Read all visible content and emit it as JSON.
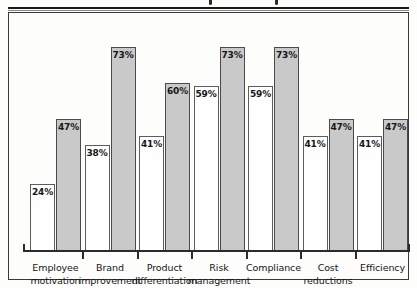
{
  "chart_data": {
    "type": "bar",
    "title": "",
    "xlabel": "",
    "ylabel": "",
    "ylim": [
      0,
      80
    ],
    "grid": false,
    "legend_position": "none",
    "categories": [
      "Employee motivation",
      "Brand improvement",
      "Product differentiation",
      "Risk management",
      "Compliance",
      "Cost reductions",
      "Efficiency"
    ],
    "series": [
      {
        "name": "series-1",
        "color": "#fefefe",
        "values": [
          24,
          38,
          41,
          59,
          59,
          41,
          41
        ]
      },
      {
        "name": "series-2",
        "color": "#c9c9c9",
        "values": [
          47,
          73,
          60,
          73,
          73,
          47,
          47
        ]
      }
    ],
    "value_labels": [
      [
        "24%",
        "47%"
      ],
      [
        "38%",
        "73%"
      ],
      [
        "41%",
        "60%"
      ],
      [
        "59%",
        "73%"
      ],
      [
        "59%",
        "73%"
      ],
      [
        "41%",
        "47%"
      ],
      [
        "41%",
        "47%"
      ]
    ]
  },
  "axis": {
    "categories_wrapped": [
      {
        "line1": "Employee",
        "line2": "motivation"
      },
      {
        "line1": "Brand",
        "line2": "improvement"
      },
      {
        "line1": "Product",
        "line2": "differentiation"
      },
      {
        "line1": "Risk",
        "line2": "management"
      },
      {
        "line1": "Compliance",
        "line2": ""
      },
      {
        "line1": "Cost",
        "line2": "reductions"
      },
      {
        "line1": "Efficiency",
        "line2": ""
      }
    ]
  },
  "colors": {
    "bar_light": "#fefefe",
    "bar_dark": "#c9c9c9",
    "bar_border": "#5c5c5c",
    "axis": "#2b2b2b",
    "frame": "#3a3a3a",
    "text": "#161616",
    "page_background": "#fdfdfc"
  }
}
